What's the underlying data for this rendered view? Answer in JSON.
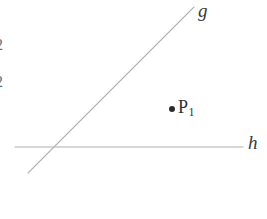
{
  "figure": {
    "background_color": "#ffffff",
    "width": 267,
    "height": 219,
    "stroke_color": "#b0b0b0",
    "text_color": "#3a3a3a",
    "point_color": "#2b2b2b"
  },
  "lines": {
    "g": {
      "label": "g",
      "name": "line-g",
      "x1": 28,
      "y1": 173,
      "x2": 194,
      "y2": 7,
      "stroke": "#b4b4b4",
      "width": 1.1
    },
    "h": {
      "label": "h",
      "name": "line-h",
      "x1": 15,
      "y1": 147,
      "x2": 243,
      "y2": 147,
      "stroke": "#b0b0b0",
      "width": 1.1
    }
  },
  "points": [
    {
      "name": "point-p1",
      "label": "P",
      "subscript": "1",
      "dot_x": 172,
      "dot_y": 109,
      "dot_radius": 3
    }
  ],
  "edge_marks": [
    {
      "text": "2",
      "name": "edge-mark-digit-2-upper"
    },
    {
      "text": "2",
      "name": "edge-mark-digit-2-lower"
    },
    {
      "text": "·",
      "name": "edge-mark-faint"
    }
  ]
}
